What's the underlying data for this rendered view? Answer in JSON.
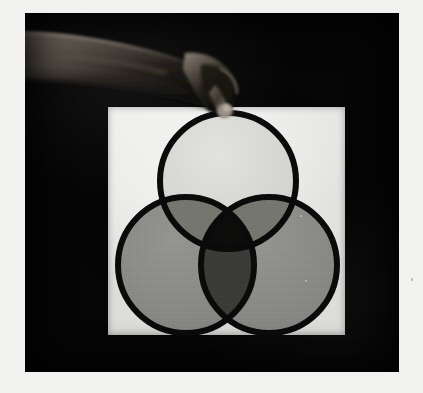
{
  "image": {
    "kind": "black-and-white-photograph",
    "subject": "A hand reaching in from the upper left to touch the top of a three-circle Venn diagram mounted on a white panel",
    "caption_text": "",
    "background_color": "#050505",
    "paper_color": "#f1f1ef",
    "board_color": "#e9e9e6",
    "outline_color": "#0a0a0a"
  },
  "photo": {
    "left": 25,
    "top": 13,
    "width": 374,
    "height": 359
  },
  "board": {
    "left": 108,
    "top": 107,
    "width": 237,
    "height": 228
  },
  "hand": {
    "description": "bare forearm and hand, dimly side-lit, entering from the upper-left corner; index finger extends down-right and its tip meets the apex of the top circle",
    "fingertip_x": 228,
    "fingertip_y": 108,
    "highlight_color": "#8d8379",
    "shadow_color": "#0b0b0b"
  },
  "venn": {
    "type": "three-set-venn",
    "radius": 68,
    "stroke_width": 6,
    "circles": [
      {
        "name": "top-circle",
        "cx": 228,
        "cy": 181,
        "fill": "#d9d9d6",
        "label": ""
      },
      {
        "name": "left-circle",
        "cx": 186,
        "cy": 265,
        "fill": "#8b8b88",
        "label": ""
      },
      {
        "name": "right-circle",
        "cx": 269,
        "cy": 265,
        "fill": "#8b8b88",
        "label": ""
      }
    ],
    "regions": [
      {
        "name": "top-only",
        "tone": "#d9d9d6"
      },
      {
        "name": "left-only",
        "tone": "#8b8b88"
      },
      {
        "name": "right-only",
        "tone": "#8b8b88"
      },
      {
        "name": "top-and-left",
        "tone": "#76766f"
      },
      {
        "name": "top-and-right",
        "tone": "#76766f"
      },
      {
        "name": "left-and-right",
        "tone": "#3a3a37"
      },
      {
        "name": "all-three-intersect",
        "tone": "#0c0c0b"
      }
    ]
  },
  "specks": [
    {
      "x": 300,
      "y": 215,
      "size": 2
    },
    {
      "x": 305,
      "y": 280,
      "size": 2
    },
    {
      "x": 282,
      "y": 163,
      "size": 2
    },
    {
      "x": 411,
      "y": 278,
      "size": 2
    }
  ]
}
